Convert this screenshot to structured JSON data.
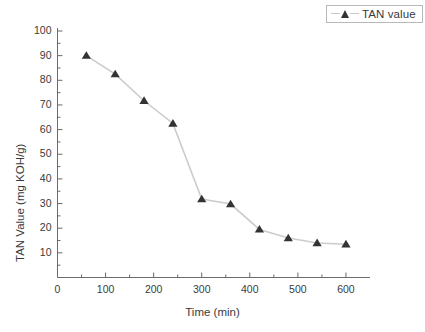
{
  "chart_data": {
    "type": "line",
    "title": "",
    "xlabel": "Time (min)",
    "ylabel": "TAN Value (mg KOH/g)",
    "xlim": [
      0,
      650
    ],
    "ylim": [
      0,
      100
    ],
    "xticks": [
      0,
      100,
      200,
      300,
      400,
      500,
      600
    ],
    "yticks": [
      0,
      10,
      20,
      30,
      40,
      50,
      60,
      70,
      80,
      90,
      100
    ],
    "xtick_labels": [
      "0",
      "100",
      "200",
      "300",
      "400",
      "500",
      "600"
    ],
    "ytick_labels": [
      "0",
      "10",
      "20",
      "30",
      "40",
      "50",
      "60",
      "70",
      "80",
      "90",
      "100"
    ],
    "minor_tick_step_x": 50,
    "minor_tick_step_y": 5,
    "grid": false,
    "legend_position": "top-right",
    "series": [
      {
        "name": "TAN value",
        "marker": "triangle-up",
        "marker_color": "#333333",
        "line_color": "#cccccc",
        "x": [
          60,
          120,
          180,
          240,
          300,
          360,
          420,
          480,
          540,
          600
        ],
        "values": [
          90.0,
          82.5,
          71.7,
          62.5,
          31.8,
          29.8,
          19.5,
          16.0,
          14.0,
          13.5
        ]
      }
    ]
  },
  "legend": {
    "entries": [
      {
        "label": "TAN value"
      }
    ]
  },
  "axes": {
    "x_title": "Time (min)",
    "y_title": "TAN Value (mg KOH/g)"
  },
  "colors": {
    "background": "#ffffff",
    "axis": "#6b6b6b",
    "marker": "#333333",
    "line": "#cccccc",
    "text": "#3a3a3a",
    "legend_border": "#b9b9b9"
  }
}
